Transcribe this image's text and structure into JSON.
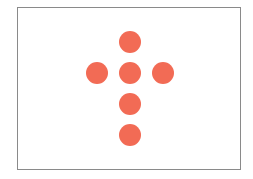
{
  "figure": {
    "shape": "cross",
    "dot_color": "#F26B55",
    "border_color": "#8a8a8a",
    "dot_count": 6,
    "dots": [
      {
        "name": "top",
        "x": 130,
        "y": 42
      },
      {
        "name": "middle-left",
        "x": 97,
        "y": 73
      },
      {
        "name": "center",
        "x": 130,
        "y": 73
      },
      {
        "name": "middle-right",
        "x": 163,
        "y": 73
      },
      {
        "name": "lower",
        "x": 130,
        "y": 104
      },
      {
        "name": "bottom",
        "x": 130,
        "y": 135
      }
    ]
  }
}
